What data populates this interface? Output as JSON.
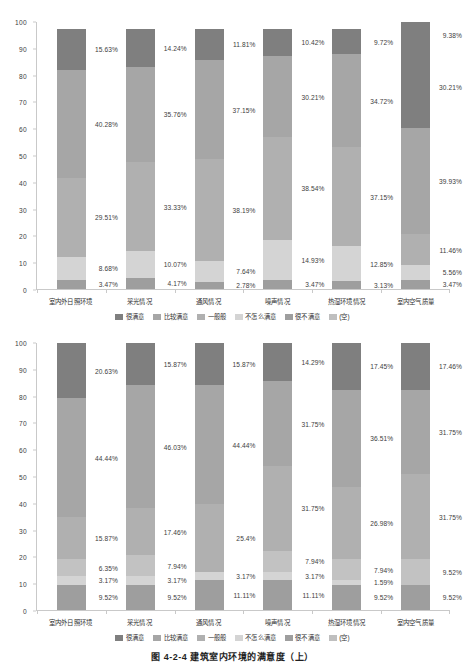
{
  "figure": {
    "caption": "图 4-2-4  建筑室内环境的满意度（上）"
  },
  "legend": {
    "position": "bottom-center",
    "entries": [
      {
        "label": "很满意",
        "color": "#7f7f7f"
      },
      {
        "label": "比较满意",
        "color": "#a6a6a6"
      },
      {
        "label": "一般般",
        "color": "#b0b0b0"
      },
      {
        "label": "不怎么满意",
        "color": "#d4d4d4"
      },
      {
        "label": "很不满意",
        "color": "#9e9e9e"
      },
      {
        "label": "(空)",
        "color": "#bfbfbf"
      }
    ]
  },
  "axis": {
    "yticks": [
      "100",
      "90",
      "80",
      "70",
      "60",
      "50",
      "40",
      "30",
      "20",
      "10",
      "0"
    ],
    "ylim": [
      0,
      100
    ]
  },
  "categories": [
    "室内外日照环境",
    "采光情况",
    "通风情况",
    "噪声情况",
    "热湿环境情况",
    "室内空气质量"
  ],
  "chart_data": [
    {
      "type": "bar",
      "subtype": "stacked-column-100",
      "title": "建筑室内环境满意度（上图）",
      "xlabel": "",
      "ylabel": "",
      "ylim": [
        0,
        100
      ],
      "grid": false,
      "legend_position": "bottom-center",
      "categories": [
        "室内外日照环境",
        "采光情况",
        "通风情况",
        "噪声情况",
        "热湿环境情况",
        "室内空气质量"
      ],
      "series": [
        {
          "name": "很不满意",
          "color": "#9e9e9e",
          "values": [
            3.47,
            4.17,
            2.78,
            3.47,
            3.13,
            3.47
          ],
          "labels": [
            "3.47%",
            "4.17%",
            "2.78%",
            "3.47%",
            "3.13%",
            "3.47%"
          ]
        },
        {
          "name": "不怎么满意",
          "color": "#d4d4d4",
          "values": [
            8.68,
            10.07,
            7.64,
            14.93,
            12.85,
            5.56
          ],
          "labels": [
            "8.68%",
            "10.07%",
            "7.64%",
            "14.93%",
            "12.85%",
            "5.56%"
          ]
        },
        {
          "name": "一般般",
          "color": "#b0b0b0",
          "values": [
            29.51,
            33.33,
            38.19,
            38.54,
            37.15,
            11.46
          ],
          "labels": [
            "29.51%",
            "33.33%",
            "38.19%",
            "38.54%",
            "37.15%",
            "11.46%"
          ]
        },
        {
          "name": "比较满意",
          "color": "#a6a6a6",
          "values": [
            40.28,
            35.76,
            37.15,
            30.21,
            34.72,
            39.93
          ],
          "labels": [
            "40.28%",
            "35.76%",
            "37.15%",
            "30.21%",
            "34.72%",
            "39.93%"
          ]
        },
        {
          "name": "很满意",
          "color": "#7f7f7f",
          "values": [
            15.63,
            14.24,
            11.81,
            10.42,
            9.72,
            30.21
          ],
          "labels": [
            "15.63%",
            "14.24%",
            "11.81%",
            "10.42%",
            "9.72%",
            "30.21%"
          ]
        },
        {
          "name": "(空)",
          "color": "#7f7f7f",
          "values": [
            0,
            0,
            0,
            0,
            0,
            9.38
          ],
          "labels": [
            "",
            "",
            "",
            "",
            "",
            "9.38%"
          ]
        }
      ]
    },
    {
      "type": "bar",
      "subtype": "stacked-column-100",
      "title": "建筑室内环境满意度（下图）",
      "xlabel": "",
      "ylabel": "",
      "ylim": [
        0,
        100
      ],
      "grid": false,
      "legend_position": "bottom-center",
      "categories": [
        "室内外日照环境",
        "采光情况",
        "通风情况",
        "噪声情况",
        "热湿环境情况",
        "室内空气质量"
      ],
      "series": [
        {
          "name": "很不满意",
          "color": "#9e9e9e",
          "values": [
            9.52,
            9.52,
            11.11,
            11.11,
            9.52,
            9.52
          ],
          "labels": [
            "9.52%",
            "9.52%",
            "11.11%",
            "11.11%",
            "9.52%",
            "9.52%"
          ]
        },
        {
          "name": "不怎么满意",
          "color": "#d4d4d4",
          "values": [
            3.17,
            3.17,
            3.17,
            3.17,
            1.59,
            0
          ],
          "labels": [
            "3.17%",
            "3.17%",
            "3.17%",
            "3.17%",
            "1.59%",
            ""
          ]
        },
        {
          "name": "一般般",
          "color": "#c2c2c2",
          "values": [
            6.35,
            7.94,
            0,
            7.94,
            7.94,
            9.52
          ],
          "labels": [
            "6.35%",
            "7.94%",
            "",
            "7.94%",
            "7.94%",
            "9.52%"
          ]
        },
        {
          "name": "比较满意",
          "color": "#b0b0b0",
          "values": [
            15.87,
            17.46,
            25.4,
            31.75,
            26.98,
            31.75
          ],
          "labels": [
            "15.87%",
            "17.46%",
            "25.4%",
            "31.75%",
            "26.98%",
            "31.75%"
          ]
        },
        {
          "name": "很满意",
          "color": "#a6a6a6",
          "values": [
            44.44,
            46.03,
            44.44,
            31.75,
            36.51,
            31.75
          ],
          "labels": [
            "44.44%",
            "46.03%",
            "44.44%",
            "31.75%",
            "36.51%",
            "31.75%"
          ]
        },
        {
          "name": "(空)",
          "color": "#7f7f7f",
          "values": [
            20.63,
            15.87,
            15.87,
            14.29,
            17.45,
            17.46
          ],
          "labels": [
            "20.63%",
            "15.87%",
            "15.87%",
            "14.29%",
            "17.45%",
            "17.46%"
          ]
        }
      ]
    }
  ]
}
